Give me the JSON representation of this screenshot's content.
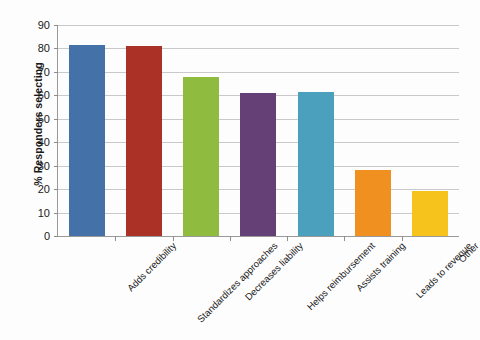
{
  "chart_data": {
    "type": "bar",
    "title": "",
    "xlabel": "",
    "ylabel": "% Responders selecting",
    "ylim": [
      0,
      90
    ],
    "ytick_step": 10,
    "grid": true,
    "legend": false,
    "categories": [
      "Adds credibility",
      "Standardizes approaches",
      "Decreases liability",
      "Helps reimbursement",
      "Assists training",
      "Leads to revenue",
      "Other"
    ],
    "values": [
      81.5,
      81,
      68,
      61,
      61.5,
      28,
      19
    ],
    "ytick_labels": [
      "90",
      "80",
      "70",
      "60",
      "50",
      "40",
      "30",
      "20",
      "10",
      "0"
    ],
    "bar_colors": [
      "#4472a8",
      "#ab3127",
      "#8fbc3f",
      "#644076",
      "#4ba0bd",
      "#ef9021",
      "#f5c31c"
    ]
  }
}
